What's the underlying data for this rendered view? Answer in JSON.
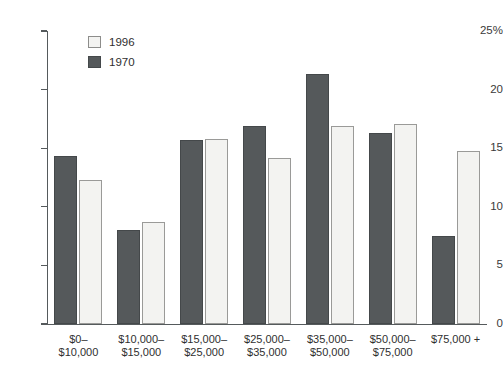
{
  "chart_data": {
    "type": "bar",
    "title": "",
    "xlabel": "",
    "ylabel": "",
    "ylim": [
      0,
      25
    ],
    "yticks": [
      0,
      5,
      10,
      15,
      20,
      25
    ],
    "ytick_labels": [
      "0",
      "5",
      "10",
      "15",
      "20",
      "25%"
    ],
    "grid": false,
    "legend_position": "top-left",
    "categories": [
      "$0–\n$10,000",
      "$10,000–\n$15,000",
      "$15,000–\n$25,000",
      "$25,000–\n$35,000",
      "$35,000–\n$50,000",
      "$50,000–\n$75,000",
      "$75,000 +"
    ],
    "category_lines": [
      [
        "$0–",
        "$10,000"
      ],
      [
        "$10,000–",
        "$15,000"
      ],
      [
        "$15,000–",
        "$25,000"
      ],
      [
        "$25,000–",
        "$35,000"
      ],
      [
        "$35,000–",
        "$50,000"
      ],
      [
        "$50,000–",
        "$75,000"
      ],
      [
        "$75,000 +",
        ""
      ]
    ],
    "series": [
      {
        "name": "1970",
        "color": "#55595b",
        "values": [
          14.3,
          8.0,
          15.7,
          16.9,
          21.3,
          16.3,
          7.5
        ]
      },
      {
        "name": "1996",
        "color": "#f3f3f1",
        "values": [
          12.3,
          8.7,
          15.8,
          14.2,
          16.9,
          17.1,
          14.8
        ]
      }
    ]
  },
  "legend": {
    "entries": [
      {
        "label": "1996",
        "swatch": "light"
      },
      {
        "label": "1970",
        "swatch": "dark"
      }
    ]
  },
  "colors": {
    "dark_bar": "#55595b",
    "light_bar": "#f3f3f1",
    "axis": "#555a5c",
    "text": "#2f2f2f",
    "background": "#ffffff"
  }
}
